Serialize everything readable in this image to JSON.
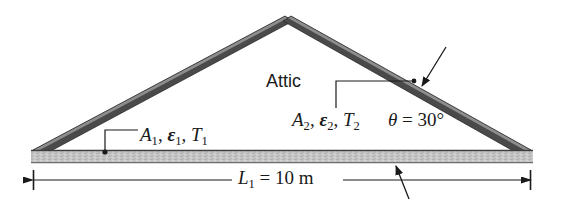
{
  "figure": {
    "colors": {
      "roof_dark": "#4a4a4a",
      "roof_highlight": "#8d8d8d",
      "slab_fill": "#c4c4c4",
      "slab_edge": "#5a5a5a",
      "line": "#1a1a1a",
      "background": "#ffffff"
    }
  },
  "labels": {
    "attic": "Attic",
    "surface_1": {
      "area": "A",
      "area_sub": "1",
      "emissivity": "ε",
      "emissivity_sub": "1",
      "temperature": "T",
      "temperature_sub": "1",
      "sep": ", "
    },
    "surface_2": {
      "area": "A",
      "area_sub": "2",
      "emissivity": "ε",
      "emissivity_sub": "2",
      "temperature": "T",
      "temperature_sub": "2",
      "sep": ", "
    },
    "angle": {
      "symbol": "θ",
      "equals": " = ",
      "value": "30",
      "unit": "°"
    },
    "length": {
      "symbol": "L",
      "symbol_sub": "1",
      "equals": " = ",
      "value": "10",
      "unit": " m"
    }
  },
  "geometry": {
    "apex": {
      "x": 288,
      "y": 16
    },
    "left_eave": {
      "x": 33,
      "y": 150
    },
    "right_eave": {
      "x": 531,
      "y": 150
    },
    "slab": {
      "x": 31,
      "y": 150,
      "width": 502,
      "height": 13
    },
    "dimension_line": {
      "y": 180,
      "x_start": 33,
      "x_end": 531
    }
  }
}
